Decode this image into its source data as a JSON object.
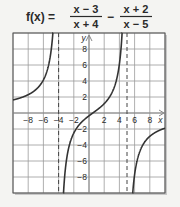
{
  "title": {
    "lhs": "f(x) =",
    "frac1_num": "x − 3",
    "frac1_den": "x + 4",
    "minus": "−",
    "frac2_num": "x + 2",
    "frac2_den": "x − 5"
  },
  "chart_data": {
    "type": "line",
    "xlabel": "x",
    "ylabel": "y",
    "xlim": [
      -10,
      10
    ],
    "ylim": [
      -10,
      10
    ],
    "grid": true,
    "x_ticks": [
      -8,
      -6,
      -4,
      -2,
      2,
      4,
      6,
      8
    ],
    "y_ticks": [
      8,
      6,
      4,
      2,
      -2,
      -4,
      -6,
      -8
    ],
    "asymptotes": {
      "vertical": [
        -4,
        5
      ],
      "horizontal": [
        0
      ]
    },
    "series": [
      {
        "name": "f(x)",
        "expression": "(x-3)/(x+4) - (x+2)/(x-5)"
      }
    ]
  },
  "colors": {
    "background": "#f4f4f2",
    "grid": "#9a9a9a",
    "curve": "#333333",
    "text": "#2a2a2a"
  }
}
